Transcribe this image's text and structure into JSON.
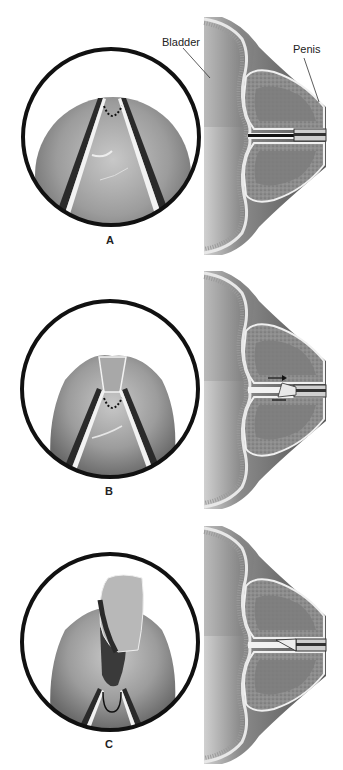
{
  "figure": {
    "annotations": {
      "bladder": "Bladder",
      "penis": "Penis"
    },
    "panels": [
      {
        "id": "A",
        "label": "A",
        "step": "Cystoscopic view: scissor blades positioned at distal edge of tissue, dotted line marks incision site"
      },
      {
        "id": "B",
        "label": "B",
        "step": "Incision made; blades advanced, arrow indicates direction"
      },
      {
        "id": "C",
        "label": "C",
        "step": "Tissue flap resected and lifted; instrument retracted"
      }
    ],
    "colors": {
      "background": "#ffffff",
      "circle_border": "#111111",
      "tissue": "#9a9a9a",
      "instrument": "#2a2a2a"
    }
  }
}
